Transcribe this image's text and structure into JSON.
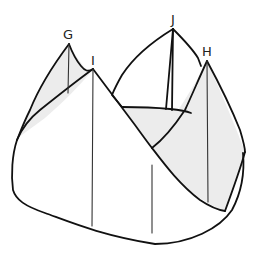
{
  "diagram": {
    "type": "solid-figure-with-peaks",
    "colors": {
      "outline": "#111111",
      "shade": "#ececec",
      "background": "#ffffff"
    },
    "vertices": [
      {
        "label": "G",
        "x": 69,
        "y": 44
      },
      {
        "label": "I",
        "x": 93,
        "y": 69
      },
      {
        "label": "J",
        "x": 173,
        "y": 29
      },
      {
        "label": "H",
        "x": 207,
        "y": 61
      }
    ],
    "labels": {
      "G": "G",
      "I": "I",
      "J": "J",
      "H": "H"
    }
  }
}
